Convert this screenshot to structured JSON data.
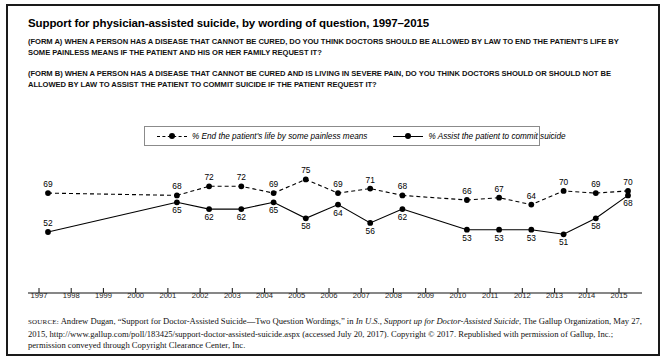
{
  "title": "Support for physician-assisted suicide, by wording of question, 1997–2015",
  "questions": {
    "form_a": "(FORM A) WHEN A PERSON HAS A DISEASE THAT CANNOT BE CURED, DO YOU THINK DOCTORS SHOULD BE ALLOWED BY LAW TO END THE PATIENT'S LIFE BY SOME PAINLESS MEANS IF THE PATIENT AND HIS OR HER FAMILY REQUEST IT?",
    "form_b": "(FORM B) WHEN A PERSON HAS A DISEASE THAT CANNOT BE CURED AND IS LIVING IN SEVERE PAIN, DO YOU THINK DOCTORS SHOULD OR SHOULD NOT BE ALLOWED BY LAW TO ASSIST THE PATIENT TO COMMIT SUICIDE IF THE PATIENT REQUEST IT?"
  },
  "legend": {
    "series_a_label": "% End the patient's life by some painless means",
    "series_b_label": "% Assist the patient to commit suicide"
  },
  "source": {
    "label": "Source:",
    "line1_a": " Andrew Dugan, “Support for Doctor-Assisted Suicide—Two Question Wordings,” in ",
    "line1_italic": "In U.S., Support up for Doctor-Assisted Suicide",
    "line1_b": ", The Gallup Organization, May 27, 2015, http://www.gallup.com/poll/183425/support-doctor-assisted-suicide.aspx (accessed July 20, 2017). Copyright © 2017. Republished with permission of Gallup, Inc.; permission conveyed through Copyright Clearance Center, Inc."
  },
  "chart_data": {
    "type": "line",
    "title": "Support for physician-assisted suicide, by wording of question, 1997–2015",
    "xlabel": "",
    "ylabel": "",
    "ylim": [
      45,
      80
    ],
    "grid": false,
    "legend_position": "top-center",
    "x": [
      1997,
      1998,
      1999,
      2000,
      2001,
      2002,
      2003,
      2004,
      2005,
      2006,
      2007,
      2008,
      2009,
      2010,
      2011,
      2012,
      2013,
      2014,
      2015
    ],
    "categories": [
      "1997",
      "1998",
      "1999",
      "2000",
      "2001",
      "2002",
      "2003",
      "2004",
      "2005",
      "2006",
      "2007",
      "2008",
      "2009",
      "2010",
      "2011",
      "2012",
      "2013",
      "2014",
      "2015"
    ],
    "series": [
      {
        "name": "% End the patient's life by some painless means",
        "style": "dashed",
        "marker": "circle",
        "color": "#000000",
        "values": [
          69,
          null,
          null,
          null,
          68,
          72,
          72,
          69,
          75,
          69,
          71,
          68,
          null,
          66,
          67,
          64,
          70,
          69,
          70
        ]
      },
      {
        "name": "% Assist the patient to commit suicide",
        "style": "solid",
        "marker": "circle",
        "color": "#000000",
        "values": [
          52,
          null,
          null,
          null,
          65,
          62,
          62,
          65,
          58,
          64,
          56,
          62,
          null,
          53,
          53,
          53,
          51,
          58,
          68
        ]
      }
    ]
  }
}
